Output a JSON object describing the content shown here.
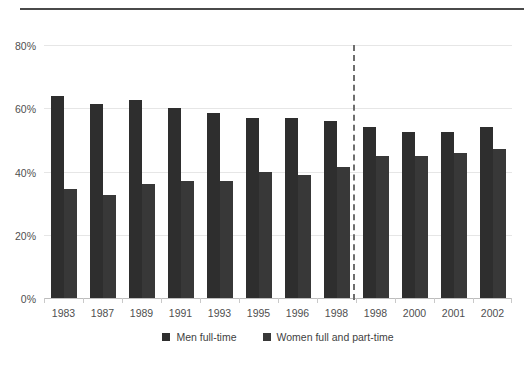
{
  "chart_data": {
    "type": "bar",
    "title": "",
    "subtitle": "",
    "xlabel": "",
    "ylabel": "",
    "ylim": [
      0,
      80
    ],
    "yticks": [
      0,
      20,
      40,
      60,
      80
    ],
    "ytick_labels": [
      "0%",
      "20%",
      "40%",
      "60%",
      "80%"
    ],
    "grid": true,
    "legend_position": "bottom-center",
    "categories": [
      "1983",
      "1987",
      "1989",
      "1991",
      "1993",
      "1995",
      "1996",
      "1998",
      "1998",
      "2000",
      "2001",
      "2002"
    ],
    "series": [
      {
        "name": "Men full-time",
        "color": "#2e2e2e",
        "values": [
          64,
          61.5,
          62.5,
          60,
          58.5,
          57,
          57,
          56,
          54,
          52.5,
          52.5,
          54
        ]
      },
      {
        "name": "Women full and part-time",
        "color": "#383838",
        "values": [
          34.5,
          32.5,
          36,
          37,
          37,
          40,
          39,
          41.5,
          45,
          45,
          46,
          47
        ]
      }
    ],
    "annotations": [
      {
        "type": "vertical-dashed-line",
        "after_category_index": 7,
        "label": ""
      }
    ]
  },
  "legend": {
    "items": [
      {
        "label": "Men full-time",
        "color": "#2e2e2e"
      },
      {
        "label": "Women full and part-time",
        "color": "#383838"
      }
    ]
  },
  "colors": {
    "men": "#2e2e2e",
    "women": "#383838",
    "grid": "#e6e6e6",
    "axis": "#bdbdbd",
    "divider": "#6e6e6e",
    "rule": "#4a4a4a",
    "text": "#4f4f4f",
    "background": "#ffffff"
  }
}
